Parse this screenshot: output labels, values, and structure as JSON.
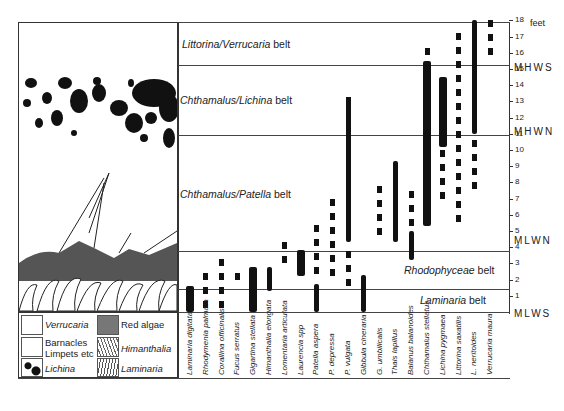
{
  "axis": {
    "unit_label": "feet",
    "ticks": [
      "1",
      "2",
      "3",
      "4",
      "5",
      "6",
      "7",
      "8",
      "9",
      "10",
      "11",
      "12",
      "13",
      "14",
      "15",
      "16",
      "17",
      "18"
    ],
    "tide_levels": [
      {
        "label": "MHWS",
        "ft": 15.2
      },
      {
        "label": "MHWN",
        "ft": 11.2
      },
      {
        "label": "MLWN",
        "ft": 4.5
      },
      {
        "label": "MLWS",
        "ft": 0
      }
    ]
  },
  "belts": [
    {
      "name": "Littorina/Verrucaria",
      "suffix": "belt",
      "from_ft": 15.2,
      "to_ft": 18
    },
    {
      "name": "Chthamalus/Lichina",
      "suffix": "belt",
      "from_ft": 11.2,
      "to_ft": 15.2
    },
    {
      "name": "Chthamalus/Patella",
      "suffix": "belt",
      "from_ft": 3.8,
      "to_ft": 11.2
    },
    {
      "name": "Rhodophyceae",
      "suffix": "belt",
      "from_ft": 1.4,
      "to_ft": 3.8
    },
    {
      "name": "Laminaria",
      "suffix": "belt",
      "from_ft": 0,
      "to_ft": 1.4
    }
  ],
  "species": [
    "Laminaria digitata",
    "Rhodymenia palmata",
    "Corallina officinalis",
    "Fucus serratus",
    "Gigartina stellata",
    "Himanthalia elongata",
    "Lomentaria articulata",
    "Laurencia spp",
    "Patella aspera",
    "P. depressa",
    "P. vulgata",
    "Gibbula cineraria",
    "G. umbilicalis",
    "Thais lapillus",
    "Balanus balanoides",
    "Chthamalus stellatus",
    "Lichina pygmaea",
    "Littorina saxatilis",
    "L. neritoides",
    "Verrucaria maura"
  ],
  "legend": [
    {
      "label": "Verrucaria",
      "italic": true
    },
    {
      "label": "Red algae",
      "italic": false
    },
    {
      "label": "Barnacles",
      "italic": false
    },
    {
      "label": "Limpets etc",
      "italic": false
    },
    {
      "label": "Himanthalia",
      "italic": true
    },
    {
      "label": "Lichina",
      "italic": true
    },
    {
      "label": "Laminaria",
      "italic": true
    }
  ],
  "chart_data": {
    "type": "range-bar",
    "title": "",
    "xlabel": "Species",
    "ylabel": "Height above MLWS (feet)",
    "ylim": [
      0,
      18
    ],
    "categories": [
      "Laminaria digitata",
      "Rhodymenia palmata",
      "Corallina officinalis",
      "Fucus serratus",
      "Gigartina stellata",
      "Himanthalia elongata",
      "Lomentaria articulata",
      "Laurencia spp",
      "Patella aspera",
      "P. depressa",
      "P. vulgata",
      "Gibbula cineraria",
      "G. umbilicalis",
      "Thais lapillus",
      "Balanus balanoides",
      "Chthamalus stellatus",
      "Lichina pygmaea",
      "Littorina saxatilis",
      "L. neritoides",
      "Verrucaria maura"
    ],
    "solid_ranges_ft": [
      [
        0,
        1.6
      ],
      [],
      [],
      [],
      [
        0,
        2.8
      ],
      [
        1.3,
        2.8
      ],
      [],
      [
        2.2,
        3.8
      ],
      [
        0,
        1.7
      ],
      [],
      [
        4.3,
        13.0
      ],
      [
        0,
        2.3
      ],
      [],
      [
        4.3,
        9.3
      ],
      [
        3.2,
        5.0
      ],
      [
        5.3,
        15.5
      ],
      [
        10.2,
        14.5
      ],
      [],
      [
        11.0,
        18
      ],
      []
    ],
    "dashed_ranges_ft": [
      [],
      [
        0,
        2.4
      ],
      [
        0,
        3.3
      ],
      [
        1.6,
        2.4
      ],
      [],
      [],
      [
        3.2,
        4.3
      ],
      [],
      [
        1.8,
        5.4
      ],
      [
        1.7,
        7.0
      ],
      [
        1.8,
        13.3
      ],
      [],
      [
        4.4,
        7.8
      ],
      [],
      [
        5.3,
        7.5
      ],
      [
        5.0,
        16.3
      ],
      [
        7.0,
        10.0
      ],
      [
        5.8,
        17.2
      ],
      [
        7.8,
        10.6
      ],
      [
        15.8,
        18
      ]
    ],
    "belts": [
      "Littorina/Verrucaria belt",
      "Chthamalus/Lichina belt",
      "Chthamalus/Patella belt",
      "Rhodophyceae belt",
      "Laminaria belt"
    ],
    "tide_levels": {
      "MHWS": 15.2,
      "MHWN": 11.2,
      "MLWN": 4.5,
      "MLWS": 0
    }
  }
}
